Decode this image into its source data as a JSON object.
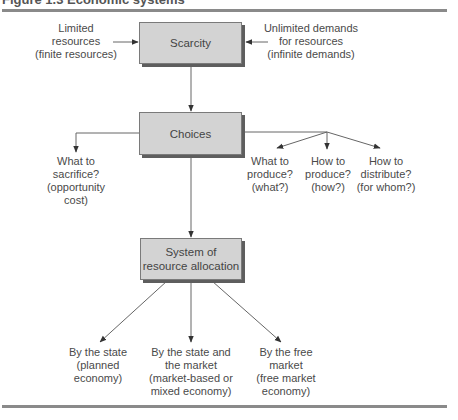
{
  "figure": {
    "title": "Figure 1.3 Economic systems"
  },
  "nodes": {
    "scarcity": {
      "label": "Scarcity"
    },
    "choices": {
      "label": "Choices"
    },
    "allocation": {
      "lines": [
        "System of",
        "resource allocation"
      ]
    }
  },
  "inputs": {
    "left": {
      "lines": [
        "Limited",
        "resources",
        "(finite resources)"
      ]
    },
    "right": {
      "lines": [
        "Unlimited demands",
        "for resources",
        "(infinite demands)"
      ]
    }
  },
  "choice_outcomes": {
    "sacrifice": {
      "lines": [
        "What to",
        "sacrifice?",
        "(opportunity",
        "cost)"
      ]
    },
    "what": {
      "lines": [
        "What to",
        "produce?",
        "(what?)"
      ]
    },
    "how": {
      "lines": [
        "How to",
        "produce?",
        "(how?)"
      ]
    },
    "whom": {
      "lines": [
        "How to",
        "distribute?",
        "(for whom?)"
      ]
    }
  },
  "systems": {
    "state": {
      "lines": [
        "By the state",
        "(planned",
        "economy)"
      ]
    },
    "mixed": {
      "lines": [
        "By the state and",
        "the market",
        "(market-based or",
        "mixed economy)"
      ]
    },
    "free": {
      "lines": [
        "By the free",
        "market",
        "(free market",
        "economy)"
      ]
    }
  },
  "colors": {
    "box_fill": "#d3d3d3",
    "box_shadow": "#5e5e5e",
    "line": "#666666",
    "rule": "#8a8a8a"
  }
}
